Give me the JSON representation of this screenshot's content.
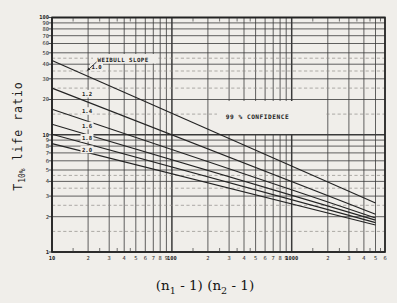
{
  "figure": {
    "background": "#f0eeea",
    "ink": "#232323",
    "grid_ink": "#3a3a3a",
    "minor_ink": "#8f8d88"
  },
  "y_axis": {
    "title_main": "T",
    "title_sub": "10%",
    "title_rest": " life ratio"
  },
  "x_axis": {
    "title_parts": [
      "(n",
      "1",
      " - 1) (n",
      "2",
      " - 1)"
    ]
  },
  "chart_data": {
    "type": "line",
    "title": "",
    "xlabel": "(n1 - 1)(n2 - 1)",
    "ylabel": "T10% life ratio",
    "x_scale": "log",
    "y_scale": "log",
    "xlim": [
      10,
      6000
    ],
    "ylim": [
      1,
      100
    ],
    "grid": true,
    "x_tick_labels": [
      "10",
      "2",
      "3",
      "4",
      "5",
      "6",
      "7",
      "8",
      "9",
      "100",
      "2",
      "3",
      "4",
      "5",
      "6",
      "7",
      "8",
      "9",
      "1000",
      "2",
      "3",
      "4",
      "5",
      "6"
    ],
    "y_tick_labels": [
      "1",
      "2",
      "3",
      "4",
      "5",
      "6",
      "7",
      "8",
      "9",
      "10",
      "20",
      "30",
      "40",
      "50",
      "60",
      "70",
      "80",
      "90",
      "100"
    ],
    "annotations": [
      {
        "id": "weibull_slope",
        "text": "WEIBULL SLOPE"
      },
      {
        "id": "confidence",
        "text": "99 % CONFIDENCE"
      }
    ],
    "series": [
      {
        "name": "1.0",
        "points": [
          [
            10,
            43.0
          ],
          [
            5000,
            2.62
          ]
        ]
      },
      {
        "name": "1.2",
        "points": [
          [
            10,
            25.0
          ],
          [
            5000,
            2.1
          ]
        ]
      },
      {
        "name": "1.4",
        "points": [
          [
            10,
            16.5
          ],
          [
            5000,
            1.95
          ]
        ]
      },
      {
        "name": "1.6",
        "points": [
          [
            10,
            12.3
          ],
          [
            5000,
            1.87
          ]
        ]
      },
      {
        "name": "1.8",
        "points": [
          [
            10,
            10.1
          ],
          [
            5000,
            1.78
          ]
        ]
      },
      {
        "name": "2.0",
        "points": [
          [
            10,
            8.4
          ],
          [
            5000,
            1.7
          ]
        ]
      }
    ]
  }
}
